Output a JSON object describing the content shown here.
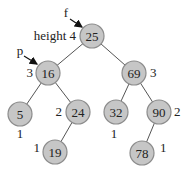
{
  "diagram": {
    "type": "avl-tree",
    "colors": {
      "node_fill": "#c6c6c6",
      "node_stroke": "#8c8c8c",
      "edge": "#555555",
      "text": "#222222"
    },
    "nodes": [
      {
        "id": "n25",
        "value": "25",
        "x": 92,
        "y": 36,
        "height_label": "height 4",
        "hx": 76,
        "hy": 40,
        "hanchor": "end"
      },
      {
        "id": "n16",
        "value": "16",
        "x": 48,
        "y": 73,
        "height_label": "3",
        "hx": 33,
        "hy": 77,
        "hanchor": "end"
      },
      {
        "id": "n69",
        "value": "69",
        "x": 134,
        "y": 73,
        "height_label": "3",
        "hx": 150,
        "hy": 77,
        "hanchor": "start"
      },
      {
        "id": "n5",
        "value": "5",
        "x": 20,
        "y": 114,
        "height_label": "1",
        "hx": 20,
        "hy": 138,
        "hanchor": "middle"
      },
      {
        "id": "n24",
        "value": "24",
        "x": 78,
        "y": 112,
        "height_label": "2",
        "hx": 62,
        "hy": 116,
        "hanchor": "end"
      },
      {
        "id": "n32",
        "value": "32",
        "x": 116,
        "y": 112,
        "height_label": "1",
        "hx": 114,
        "hy": 138,
        "hanchor": "middle"
      },
      {
        "id": "n90",
        "value": "90",
        "x": 159,
        "y": 112,
        "height_label": "2",
        "hx": 174,
        "hy": 116,
        "hanchor": "start"
      },
      {
        "id": "n19",
        "value": "19",
        "x": 55,
        "y": 152,
        "height_label": "1",
        "hx": 40,
        "hy": 152,
        "hanchor": "end"
      },
      {
        "id": "n78",
        "value": "78",
        "x": 142,
        "y": 153,
        "height_label": "1",
        "hx": 160,
        "hy": 152,
        "hanchor": "start"
      }
    ],
    "edges": [
      [
        "n25",
        "n16"
      ],
      [
        "n25",
        "n69"
      ],
      [
        "n16",
        "n5"
      ],
      [
        "n16",
        "n24"
      ],
      [
        "n24",
        "n19"
      ],
      [
        "n69",
        "n32"
      ],
      [
        "n69",
        "n90"
      ],
      [
        "n90",
        "n78"
      ]
    ],
    "pointers": [
      {
        "label": "f",
        "lx": 66,
        "ly": 17,
        "x1": 70,
        "y1": 19,
        "x2": 82,
        "y2": 27,
        "target": "n25"
      },
      {
        "label": "p",
        "lx": 20,
        "ly": 55,
        "x1": 24,
        "y1": 56,
        "x2": 37,
        "y2": 64,
        "target": "n16"
      }
    ]
  }
}
